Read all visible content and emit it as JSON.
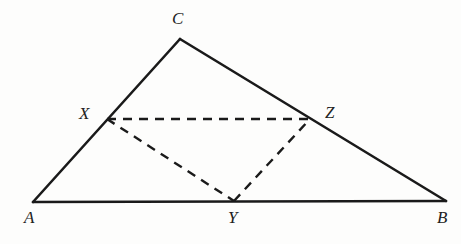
{
  "figure": {
    "type": "geometry-diagram",
    "canvas": {
      "width": 461,
      "height": 244
    },
    "colors": {
      "background": "#fdfdfc",
      "stroke": "#1a1a1a",
      "dashed_stroke": "#1a1a1a",
      "label": "#222222"
    },
    "stroke_widths": {
      "solid": 2.6,
      "dashed": 2.4
    },
    "dash_pattern": "9 7",
    "points": [
      {
        "id": "A",
        "label": "A",
        "x": 33,
        "y": 202,
        "label_x": 24,
        "label_y": 209,
        "on": "triangle-vertex"
      },
      {
        "id": "B",
        "label": "B",
        "x": 446,
        "y": 201,
        "label_x": 437,
        "label_y": 209,
        "on": "triangle-vertex"
      },
      {
        "id": "C",
        "label": "C",
        "x": 180,
        "y": 39,
        "label_x": 172,
        "label_y": 10,
        "on": "triangle-vertex"
      },
      {
        "id": "X",
        "label": "X",
        "x": 107,
        "y": 119,
        "label_x": 79,
        "label_y": 105,
        "on": "segment-AC"
      },
      {
        "id": "Y",
        "label": "Y",
        "x": 234,
        "y": 201,
        "label_x": 228,
        "label_y": 209,
        "on": "segment-AB"
      },
      {
        "id": "Z",
        "label": "Z",
        "x": 310,
        "y": 119,
        "label_x": 325,
        "label_y": 104,
        "on": "segment-CB"
      }
    ],
    "solid_segments": [
      {
        "id": "AB",
        "from": "A",
        "to": "B",
        "x1": 33,
        "y1": 202,
        "x2": 446,
        "y2": 201
      },
      {
        "id": "AC",
        "from": "A",
        "to": "C",
        "x1": 33,
        "y1": 202,
        "x2": 180,
        "y2": 39
      },
      {
        "id": "CB",
        "from": "C",
        "to": "B",
        "x1": 180,
        "y1": 39,
        "x2": 446,
        "y2": 201
      }
    ],
    "dashed_segments": [
      {
        "id": "XZ",
        "from": "X",
        "to": "Z",
        "x1": 107,
        "y1": 119,
        "x2": 310,
        "y2": 119
      },
      {
        "id": "XY",
        "from": "X",
        "to": "Y",
        "x1": 107,
        "y1": 119,
        "x2": 234,
        "y2": 201
      },
      {
        "id": "YZ",
        "from": "Y",
        "to": "Z",
        "x1": 234,
        "y1": 201,
        "x2": 310,
        "y2": 119
      }
    ]
  }
}
